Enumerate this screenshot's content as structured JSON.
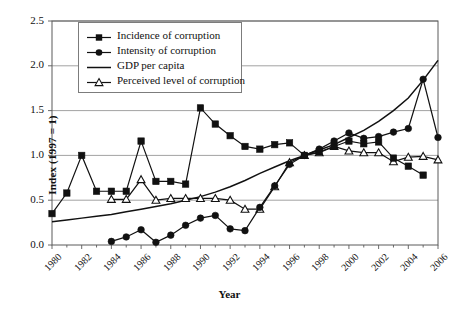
{
  "chart_data": {
    "type": "line",
    "title": "",
    "xlabel": "Year",
    "ylabel": "Index (1997 = 1)",
    "xlim": [
      1980,
      2006
    ],
    "ylim": [
      0.0,
      2.5
    ],
    "grid": "horizontal",
    "legend_position": "top-left-inside",
    "ytick_labels": [
      "0.0",
      "0.5",
      "1.0",
      "1.5",
      "2.0",
      "2.5"
    ],
    "ytick_values": [
      0.0,
      0.5,
      1.0,
      1.5,
      2.0,
      2.5
    ],
    "xtick_labels": [
      "1980",
      "1982",
      "1984",
      "1986",
      "1988",
      "1990",
      "1992",
      "1994",
      "1996",
      "1998",
      "2000",
      "2002",
      "2004",
      "2006"
    ],
    "xtick_values": [
      1980,
      1982,
      1984,
      1986,
      1988,
      1990,
      1992,
      1994,
      1996,
      1998,
      2000,
      2002,
      2004,
      2006
    ],
    "x": [
      1980,
      1981,
      1982,
      1983,
      1984,
      1985,
      1986,
      1987,
      1988,
      1989,
      1990,
      1991,
      1992,
      1993,
      1994,
      1995,
      1996,
      1997,
      1998,
      1999,
      2000,
      2001,
      2002,
      2003,
      2004,
      2005,
      2006
    ],
    "series": [
      {
        "name": "Incidence of corruption",
        "marker": "filled-square",
        "values": [
          0.35,
          0.58,
          1.0,
          0.6,
          0.6,
          0.6,
          1.16,
          0.71,
          0.71,
          0.68,
          1.53,
          1.35,
          1.22,
          1.1,
          1.07,
          1.12,
          1.14,
          1.0,
          1.04,
          1.1,
          1.16,
          1.13,
          1.15,
          0.97,
          0.88,
          0.78,
          null
        ]
      },
      {
        "name": "Intensity of corruption",
        "marker": "filled-circle",
        "values": [
          null,
          null,
          null,
          null,
          0.04,
          0.09,
          0.17,
          0.03,
          0.11,
          0.22,
          0.3,
          0.33,
          0.18,
          0.16,
          0.42,
          0.66,
          0.9,
          1.0,
          1.07,
          1.16,
          1.25,
          1.19,
          1.21,
          1.26,
          1.3,
          1.85,
          1.2
        ]
      },
      {
        "name": "GDP per capita",
        "marker": "none",
        "values": [
          0.26,
          0.28,
          0.3,
          0.32,
          0.34,
          0.37,
          0.4,
          0.43,
          0.46,
          0.5,
          0.54,
          0.59,
          0.65,
          0.72,
          0.8,
          0.87,
          0.94,
          1.0,
          1.06,
          1.12,
          1.2,
          1.28,
          1.38,
          1.5,
          1.64,
          1.84,
          2.06
        ]
      },
      {
        "name": "Perceived level of corruption",
        "marker": "open-triangle",
        "values": [
          null,
          null,
          null,
          null,
          0.51,
          0.51,
          0.73,
          0.5,
          0.52,
          0.52,
          0.52,
          0.52,
          0.5,
          0.4,
          0.4,
          0.65,
          0.92,
          1.0,
          1.03,
          1.1,
          1.05,
          1.03,
          1.03,
          0.93,
          0.98,
          0.99,
          0.95
        ]
      }
    ]
  },
  "legend": {
    "items": [
      {
        "label": "Incidence of corruption",
        "key": "line-filled-square"
      },
      {
        "label": "Intensity of corruption",
        "key": "line-filled-circle"
      },
      {
        "label": "GDP per capita",
        "key": "line-plain"
      },
      {
        "label": "Perceived level of corruption",
        "key": "line-open-triangle"
      }
    ]
  },
  "colors": {
    "ink": "#111111",
    "grid": "#8a8a8a",
    "axis": "#5a5a5a",
    "legend_border": "#7c7c7c",
    "background": "#ffffff"
  }
}
